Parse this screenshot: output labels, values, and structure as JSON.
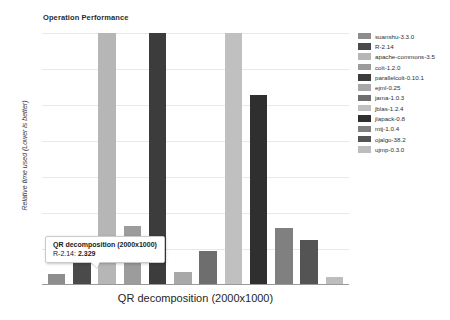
{
  "chart_data": {
    "type": "bar",
    "title": "Operation Performance",
    "xlabel": "QR decomposition (2000x1000)",
    "ylabel": "Relative time used (Lower is better)",
    "grid": true,
    "legend_position": "right",
    "ylim": [
      0,
      10
    ],
    "categories": [
      "suanshu-3.3.0",
      "R-2.14",
      "apache-commons-3.5",
      "colt-1.2.0",
      "parallelcolt-0.10.1",
      "ejml-0.25",
      "jama-1.0.3",
      "jblas-1.2.4",
      "jlapack-0.8",
      "mtj-1.0.4",
      "ojalgo-38.2",
      "ujmp-0.3.0"
    ],
    "values": [
      0.42,
      1.05,
      10.0,
      2.329,
      10.0,
      0.52,
      1.34,
      10.0,
      7.55,
      2.25,
      1.78,
      0.33
    ],
    "colors": [
      "#8d8d8d",
      "#4a4a4a",
      "#b6b6b6",
      "#9c9c9c",
      "#3c3c3c",
      "#a8a8a8",
      "#6e6e6e",
      "#c0c0c0",
      "#2f2f2f",
      "#808080",
      "#545454",
      "#bdbdbd"
    ],
    "gridline_count": 7
  },
  "tooltip": {
    "title": "QR decomposition (2000x1000)",
    "series": "R-2.14:",
    "value": "2.329"
  }
}
